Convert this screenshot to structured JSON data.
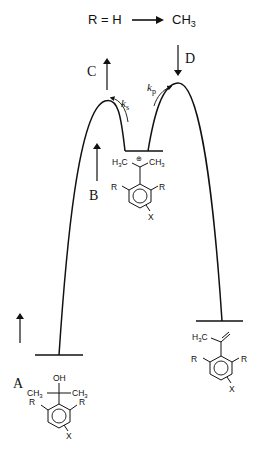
{
  "header": {
    "left": "R = H",
    "arrow": "→",
    "right_main": "CH",
    "right_sub": "3"
  },
  "labels": {
    "A": "A",
    "B": "B",
    "C": "C",
    "D": "D",
    "ks_main": "k",
    "ks_sub": "s",
    "kp_main": "k",
    "kp_sub": "p"
  },
  "molecules": {
    "alcohol": {
      "oh": "OH",
      "ch3_left": "CH",
      "ch3_left_sub": "3",
      "ch3_right": "CH",
      "ch3_right_sub": "3",
      "r_left": "R",
      "r_right": "R",
      "x": "X"
    },
    "carbocation": {
      "h3c": "H",
      "h3c_sub": "3",
      "h3c_c": "C",
      "charge": "⊕",
      "ch3": "CH",
      "ch3_sub": "3",
      "r_left": "R",
      "r_right": "R",
      "x": "X"
    },
    "alkene": {
      "h3c": "H",
      "h3c_sub": "3",
      "h3c_c": "C",
      "r_left": "R",
      "r_right": "R",
      "x": "X"
    }
  },
  "colors": {
    "line": "#111111",
    "background": "#ffffff"
  }
}
